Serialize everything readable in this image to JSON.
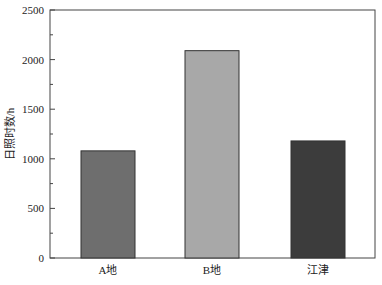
{
  "chart_data": {
    "type": "bar",
    "title": "",
    "xlabel": "",
    "ylabel": "日照时数/h",
    "categories": [
      "A地",
      "B地",
      "江津"
    ],
    "values": [
      1080,
      2090,
      1180
    ],
    "colors": [
      "#6e6e6e",
      "#a8a8a8",
      "#3c3c3c"
    ],
    "ylim": [
      0,
      2500
    ],
    "yticks": [
      0,
      500,
      1000,
      1500,
      2000,
      2500
    ],
    "ytick_labels": [
      "0",
      "500",
      "1000",
      "1500",
      "2000",
      "2500"
    ],
    "minor_ticks": true,
    "grid": false,
    "legend": null
  }
}
